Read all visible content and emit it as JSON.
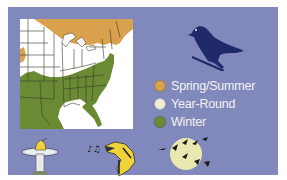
{
  "infographic": {
    "subject_icon": "bird-silhouette-icon",
    "map": {
      "region": "Eastern United States",
      "ranges": [
        "spring-summer",
        "year-round",
        "winter"
      ]
    },
    "legend": {
      "items": [
        {
          "label": "Spring/Summer",
          "color": "#d9a04e"
        },
        {
          "label": "Year-Round",
          "color": "#f0eed8"
        },
        {
          "label": "Winter",
          "color": "#6b8a34"
        }
      ]
    },
    "behavior_icons": [
      {
        "name": "birdbath-icon"
      },
      {
        "name": "singing-bird-icon"
      },
      {
        "name": "night-migration-icon"
      }
    ],
    "colors": {
      "panel": "#8088bc",
      "bird": "#1f2a6b",
      "map_background": "#ffffff",
      "moon": "#e8e9b0"
    }
  }
}
